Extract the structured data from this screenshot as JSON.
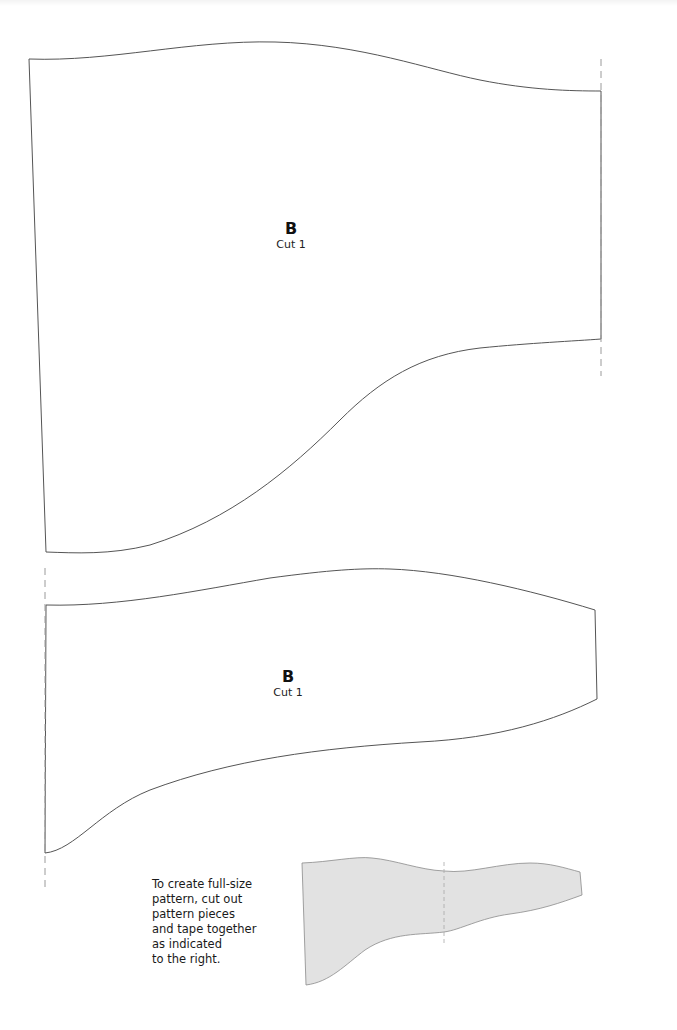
{
  "document": {
    "type": "sewing-pattern-sheet",
    "background_color": "#ffffff",
    "outline_color": "#555555",
    "fold_line_color": "#9a9a9a",
    "thumbnail_fill_color": "#e2e2e2"
  },
  "pieces": [
    {
      "id": "piece-upper",
      "label": {
        "letter": "B",
        "cut": "Cut 1"
      },
      "outline_path": "M29,59 C110,62 190,40 275,42 C360,44 430,70 480,80 C530,90 570,91 601,91 L601,339 C575,341 530,343 480,348 C420,355 380,380 340,420 C290,470 230,520 150,545 C110,555 75,553 46,552 L29,59 Z",
      "fold_line": {
        "x": 601,
        "y1": 59,
        "y2": 376
      }
    },
    {
      "id": "piece-lower",
      "label": {
        "letter": "B",
        "cut": "Cut 1"
      },
      "outline_path": "M46,605 C120,607 200,590 270,578 C330,570 360,568 390,569 C450,571 530,590 595,610 L597,699 C555,720 500,738 420,742 C320,748 230,760 150,790 C100,810 75,850 45,853 L46,605 Z",
      "fold_line": {
        "x": 45,
        "y1": 568,
        "y2": 890
      }
    }
  ],
  "thumbnail": {
    "outline_path": "M302,863 C330,862 355,856 372,858 C395,860 420,870 444,871 C470,874 500,863 530,863 C550,863 565,868 580,872 L582,895 C560,903 540,910 510,914 C480,918 460,930 444,932 C420,935 392,932 365,950 C345,965 330,982 306,985 Z",
    "seam": {
      "x": 444,
      "y1": 862,
      "y2": 944
    }
  },
  "instructions": {
    "lines": [
      "To create full-size",
      "pattern, cut out",
      "pattern pieces",
      "and tape together",
      "as indicated",
      "to the right."
    ]
  }
}
